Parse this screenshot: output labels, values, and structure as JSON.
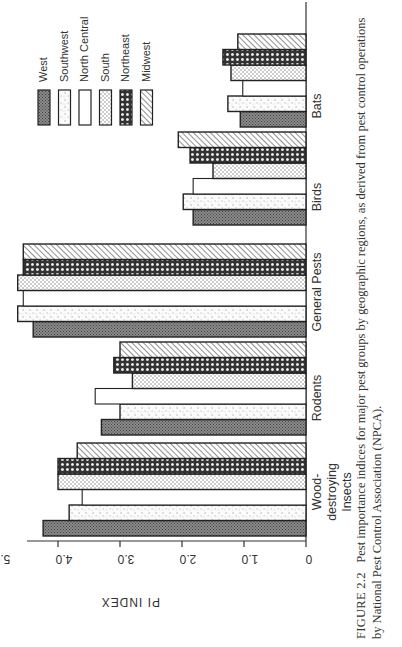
{
  "chart_data": {
    "type": "bar",
    "orientation": "vertical (page rotated 90°)",
    "title": "",
    "xlabel": "",
    "ylabel": "PI INDEX",
    "ylim": [
      0,
      5.0
    ],
    "yticks": [
      "0",
      "1.0",
      "2.0",
      "3.0",
      "4.0",
      "5.0"
    ],
    "grid": false,
    "legend_position": "upper right",
    "categories": [
      "Wood-destroying Insects",
      "Rodents",
      "General Pests",
      "Birds",
      "Bats"
    ],
    "series": [
      {
        "name": "West",
        "pattern": "dark crosshatch",
        "values": [
          4.24,
          3.3,
          4.4,
          1.82,
          1.06
        ]
      },
      {
        "name": "Southwest",
        "pattern": "sparse stipple",
        "values": [
          3.82,
          3.0,
          4.65,
          1.98,
          1.26
        ]
      },
      {
        "name": "North Central",
        "pattern": "blank",
        "values": [
          3.61,
          3.4,
          4.56,
          1.82,
          1.02
        ]
      },
      {
        "name": "South",
        "pattern": "dot grid",
        "values": [
          4.0,
          2.8,
          4.65,
          1.5,
          1.21
        ]
      },
      {
        "name": "Northeast",
        "pattern": "heavy lattice",
        "values": [
          4.0,
          3.1,
          4.56,
          1.87,
          1.34
        ]
      },
      {
        "name": "Midwest",
        "pattern": "diagonal hatch",
        "values": [
          3.69,
          3.0,
          4.56,
          2.06,
          1.1
        ]
      }
    ]
  },
  "axis": {
    "ylabel": "PI INDEX",
    "ticks": [
      "0",
      "1.0",
      "2.0",
      "3.0",
      "4.0",
      "5.0"
    ]
  },
  "categories": {
    "c0_line1": "Wood-destroying",
    "c0_line2": "Insects",
    "c1": "Rodents",
    "c2": "General Pests",
    "c3": "Birds",
    "c4": "Bats"
  },
  "legend": [
    "West",
    "Southwest",
    "North Central",
    "South",
    "Northeast",
    "Midwest"
  ],
  "caption": {
    "figure": "FIGURE 2.2",
    "text": "Pest importance indices for major pest groups by geographic regions, as derived from pest control operations by National Pest Control Association (NPCA)."
  }
}
